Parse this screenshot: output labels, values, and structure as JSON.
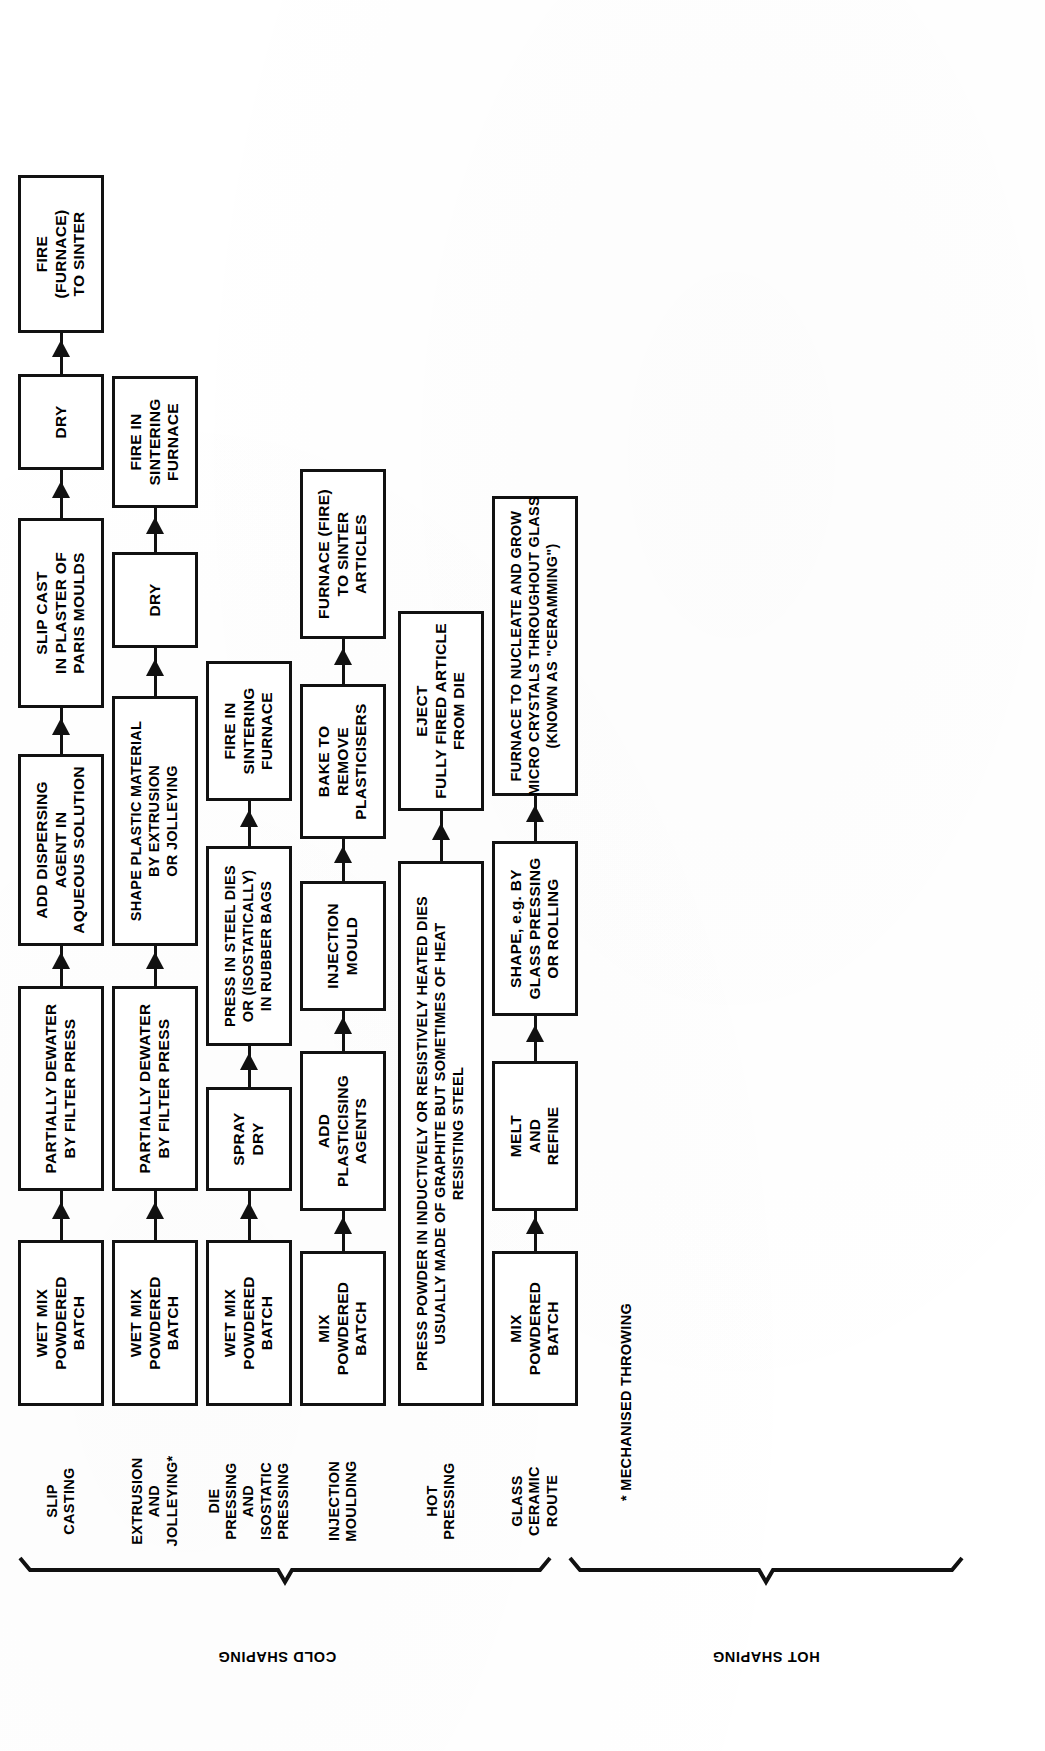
{
  "diagram": {
    "footnote": "* MECHANISED THROWING",
    "groups": [
      {
        "id": "cold-shaping",
        "label": "COLD SHAPING"
      },
      {
        "id": "hot-shaping",
        "label": "HOT SHAPING"
      }
    ],
    "routes": [
      {
        "id": "slip-casting",
        "label_lines": [
          "SLIP",
          "CASTING"
        ],
        "group": "cold-shaping",
        "steps": [
          {
            "id": "s1-1",
            "lines": [
              "WET MIX",
              "POWDERED",
              "BATCH"
            ]
          },
          {
            "id": "s1-2",
            "lines": [
              "PARTIALLY DEWATER",
              "BY FILTER PRESS"
            ]
          },
          {
            "id": "s1-3",
            "lines": [
              "ADD DISPERSING",
              "AGENT IN",
              "AQUEOUS SOLUTION"
            ]
          },
          {
            "id": "s1-4",
            "lines": [
              "SLIP CAST",
              "IN PLASTER OF",
              "PARIS MOULDS"
            ]
          },
          {
            "id": "s1-5",
            "lines": [
              "DRY"
            ]
          },
          {
            "id": "s1-6",
            "lines": [
              "FIRE",
              "(FURNACE)",
              "TO SINTER"
            ]
          }
        ]
      },
      {
        "id": "extrusion-and-jolleying",
        "label_lines": [
          "EXTRUSION",
          "AND",
          "JOLLEYING*"
        ],
        "group": "cold-shaping",
        "steps": [
          {
            "id": "s2-1",
            "lines": [
              "WET MIX",
              "POWDERED",
              "BATCH"
            ]
          },
          {
            "id": "s2-2",
            "lines": [
              "PARTIALLY DEWATER",
              "BY FILTER PRESS"
            ]
          },
          {
            "id": "s2-3",
            "lines": [
              "SHAPE PLASTIC MATERIAL",
              "BY EXTRUSION",
              "OR JOLLEYING"
            ]
          },
          {
            "id": "s2-4",
            "lines": [
              "DRY"
            ]
          },
          {
            "id": "s2-5",
            "lines": [
              "FIRE IN",
              "SINTERING",
              "FURNACE"
            ]
          }
        ]
      },
      {
        "id": "die-pressing-and-isostatic-pressing",
        "label_lines": [
          "DIE",
          "PRESSING",
          "AND",
          "ISOSTATIC",
          "PRESSING"
        ],
        "group": "cold-shaping",
        "steps": [
          {
            "id": "s3-1",
            "lines": [
              "WET MIX",
              "POWDERED",
              "BATCH"
            ]
          },
          {
            "id": "s3-2",
            "lines": [
              "SPRAY",
              "DRY"
            ]
          },
          {
            "id": "s3-3",
            "lines": [
              "PRESS IN STEEL DIES",
              "OR (ISOSTATICALLY)",
              "IN RUBBER BAGS"
            ]
          },
          {
            "id": "s3-4",
            "lines": [
              "FIRE IN",
              "SINTERING",
              "FURNACE"
            ]
          }
        ]
      },
      {
        "id": "injection-moulding",
        "label_lines": [
          "INJECTION",
          "MOULDING"
        ],
        "group": "cold-shaping",
        "steps": [
          {
            "id": "s4-1",
            "lines": [
              "MIX",
              "POWDERED",
              "BATCH"
            ]
          },
          {
            "id": "s4-2",
            "lines": [
              "ADD",
              "PLASTICISING",
              "AGENTS"
            ]
          },
          {
            "id": "s4-3",
            "lines": [
              "INJECTION",
              "MOULD"
            ]
          },
          {
            "id": "s4-4",
            "lines": [
              "BAKE TO",
              "REMOVE",
              "PLASTICISERS"
            ]
          },
          {
            "id": "s4-5",
            "lines": [
              "FURNACE (FIRE)",
              "TO SINTER",
              "ARTICLES"
            ]
          }
        ]
      },
      {
        "id": "hot-pressing",
        "label_lines": [
          "HOT",
          "PRESSING"
        ],
        "group": "hot-shaping",
        "steps": [
          {
            "id": "s5-1",
            "lines": [
              "PRESS POWDER IN INDUCTIVELY OR RESISTIVELY HEATED DIES",
              "USUALLY MADE OF GRAPHITE  BUT SOMETIMES OF HEAT",
              "RESISTING STEEL"
            ]
          },
          {
            "id": "s5-2",
            "lines": [
              "EJECT",
              "FULLY FIRED ARTICLE",
              "FROM DIE"
            ]
          }
        ]
      },
      {
        "id": "glass-ceramic-route",
        "label_lines": [
          "GLASS",
          "CERAMIC",
          "ROUTE"
        ],
        "group": "hot-shaping",
        "steps": [
          {
            "id": "s6-1",
            "lines": [
              "MIX",
              "POWDERED",
              "BATCH"
            ]
          },
          {
            "id": "s6-2",
            "lines": [
              "MELT",
              "AND",
              "REFINE"
            ]
          },
          {
            "id": "s6-3",
            "lines": [
              "SHAPE, e.g. BY",
              "GLASS PRESSING",
              "OR ROLLING"
            ]
          },
          {
            "id": "s6-4",
            "lines": [
              "FURNACE TO NUCLEATE AND GROW",
              "MICRO CRYSTALS THROUGHOUT GLASS",
              "(KNOWN AS \"CERAMMING\")"
            ]
          }
        ]
      }
    ],
    "colors": {
      "ink": "#111111",
      "paper": "#ffffff"
    }
  }
}
